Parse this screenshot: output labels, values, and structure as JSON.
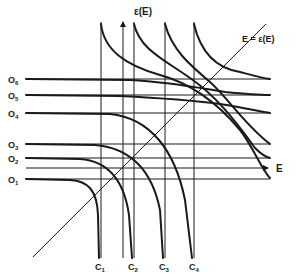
{
  "diagram": {
    "axis_labels": {
      "y_axis": "ε(E)",
      "x_axis": "E",
      "diagonal": "E = ε(E)"
    },
    "open_channel_labels": [
      {
        "base": "O",
        "sub": "6"
      },
      {
        "base": "O",
        "sub": "5"
      },
      {
        "base": "O",
        "sub": "4"
      },
      {
        "base": "O",
        "sub": "3"
      },
      {
        "base": "O",
        "sub": "2"
      },
      {
        "base": "O",
        "sub": "1"
      }
    ],
    "closed_channel_labels": [
      {
        "base": "C",
        "sub": "1"
      },
      {
        "base": "C",
        "sub": "2"
      },
      {
        "base": "C",
        "sub": "3"
      },
      {
        "base": "C",
        "sub": "4"
      }
    ],
    "colors": {
      "ink": "#1a1a1a",
      "background": "#ffffff"
    }
  }
}
